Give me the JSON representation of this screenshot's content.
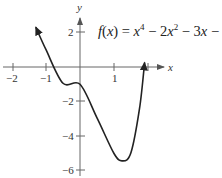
{
  "chart_data": {
    "type": "line",
    "title": "",
    "equation_label": "f(x) = x^4 − 2x^2 − 3x −",
    "equation_parts": {
      "f": "f",
      "open": "(",
      "x1": "x",
      "close_eq": ") = ",
      "x2": "x",
      "exp4": "4",
      "minus2": " − 2",
      "x3": "x",
      "exp2": "2",
      "minus3": " − 3",
      "x4": "x",
      "tail": " −"
    },
    "xlabel": "x",
    "ylabel": "y",
    "x_ticks": [
      {
        "value": -2,
        "label": "−2"
      },
      {
        "value": -1,
        "label": "−1"
      },
      {
        "value": 1,
        "label": "1"
      }
    ],
    "y_ticks": [
      {
        "value": 2,
        "label": "2"
      },
      {
        "value": -2,
        "label": "−2"
      },
      {
        "value": -4,
        "label": "−4"
      },
      {
        "value": -6,
        "label": "−6"
      }
    ],
    "xlim": [
      -2.3,
      2.2
    ],
    "ylim": [
      -6.2,
      3.0
    ],
    "grid": false,
    "series": [
      {
        "name": "f(x)",
        "arrows": "both ends",
        "x": [
          -1.3,
          -1.0,
          -0.5,
          0.0,
          0.5,
          1.0,
          1.25,
          1.5,
          1.75,
          1.9
        ],
        "y": [
          2.3,
          1.0,
          -0.94,
          -1.0,
          -2.94,
          -5.0,
          -5.43,
          -4.94,
          -2.41,
          0.26
        ]
      }
    ],
    "colors": {
      "curve": "#222222",
      "axes": "#555555"
    }
  }
}
